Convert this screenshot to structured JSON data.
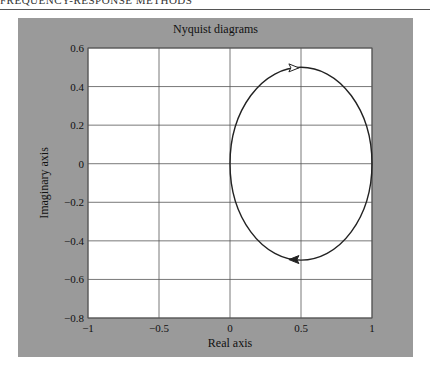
{
  "page": {
    "header_text": "FREQUENCY-RESPONSE METHODS"
  },
  "chart_data": {
    "type": "line",
    "title": "Nyquist diagrams",
    "xlabel": "Real axis",
    "ylabel": "Imaginary axis",
    "xlim": [
      -1,
      1
    ],
    "ylim": [
      -0.8,
      0.6
    ],
    "xticks": [
      -1,
      -0.5,
      0,
      0.5,
      1
    ],
    "xtick_labels": [
      "−1",
      "−0.5",
      "0",
      "0.5",
      "1"
    ],
    "yticks": [
      0.6,
      0.4,
      0.2,
      0,
      -0.2,
      -0.4,
      -0.6,
      -0.8
    ],
    "ytick_labels": [
      "0.6",
      "0.4",
      "0.2",
      "0",
      "−0.2",
      "−0.4",
      "−0.6",
      "−0.8"
    ],
    "grid": true,
    "legend": null,
    "series": [
      {
        "name": "Nyquist locus",
        "shape": "circle",
        "center": [
          0.5,
          0
        ],
        "radius": 0.5,
        "points": [
          [
            0,
            0
          ],
          [
            0.067,
            0.25
          ],
          [
            0.25,
            0.433
          ],
          [
            0.5,
            0.5
          ],
          [
            0.75,
            0.433
          ],
          [
            0.933,
            0.25
          ],
          [
            1,
            0
          ],
          [
            0.933,
            -0.25
          ],
          [
            0.75,
            -0.433
          ],
          [
            0.5,
            -0.5
          ],
          [
            0.25,
            -0.433
          ],
          [
            0.067,
            -0.25
          ],
          [
            0,
            0
          ]
        ],
        "arrows": [
          {
            "at": [
              0.45,
              0.497
            ],
            "direction": "right"
          },
          {
            "at": [
              0.45,
              -0.497
            ],
            "direction": "left"
          }
        ]
      }
    ],
    "colors": {
      "frame": "#9a9a9a",
      "plot_bg": "#ffffff",
      "grid": "#555555",
      "curve": "#222222"
    }
  }
}
